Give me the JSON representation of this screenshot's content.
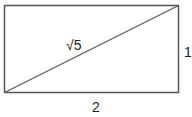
{
  "diagram": {
    "shape": "rectangle",
    "width_units": 2,
    "height_units": 1,
    "has_diagonal": true,
    "labels": {
      "diagonal": "√5",
      "right_side": "1",
      "bottom_side": "2"
    },
    "stroke_color": "#555555",
    "text_color": "#222222"
  }
}
